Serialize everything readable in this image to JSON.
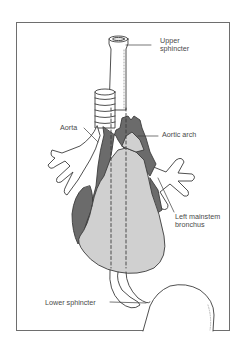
{
  "figure": {
    "colors": {
      "outline": "#3c3c3c",
      "heart_fill": "#d0d0d0",
      "vessel_fill": "#6b6b6b",
      "background": "#ffffff",
      "frame": "#6e6e6e"
    }
  },
  "labels": {
    "upper_sphincter": "Upper\nsphincter",
    "aorta": "Aorta",
    "aortic_arch": "Aortic arch",
    "left_mainstem_bronchus": "Left mainstem\nbronchus",
    "lower_sphincter": "Lower sphincter"
  }
}
